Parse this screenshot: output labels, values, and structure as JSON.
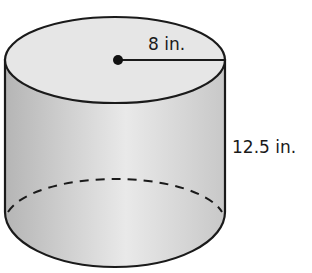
{
  "figure": {
    "shape": "cylinder",
    "radius_label": "8 in.",
    "height_label": "12.5 in.",
    "colors": {
      "stroke": "#1a1a1a",
      "top_fill": "#e6e6e6",
      "side_dark": "#b8b8b8",
      "side_light": "#e8e8e8"
    }
  }
}
